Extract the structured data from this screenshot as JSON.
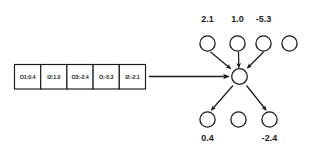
{
  "diagram": {
    "colors": {
      "stroke": "#1a1a1a",
      "fill": "#ffffff",
      "background": "#ffffff"
    },
    "memory_table": {
      "name": "memory-buffer",
      "cells": [
        {
          "label": "O1:0.4"
        },
        {
          "label": "I2:1.0"
        },
        {
          "label": "O3:-2.4"
        },
        {
          "label": "O:-5.3"
        },
        {
          "label": "I2:-2.1"
        }
      ]
    },
    "feed_arrow": {
      "name": "buffer-to-node-arrow",
      "label": ""
    },
    "top_nodes": [
      {
        "label": "2.1",
        "has_edge": true
      },
      {
        "label": "1.0",
        "has_edge": true
      },
      {
        "label": "-5.3",
        "has_edge": true
      },
      {
        "label": "",
        "has_edge": false
      }
    ],
    "center_node": {
      "name": "center-node",
      "label": ""
    },
    "bottom_nodes": [
      {
        "label": "0.4",
        "has_edge": true
      },
      {
        "label": "",
        "has_edge": false
      },
      {
        "label": "-2.4",
        "has_edge": true
      }
    ]
  }
}
